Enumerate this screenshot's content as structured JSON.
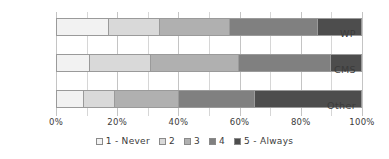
{
  "chart_data": {
    "type": "bar",
    "orientation": "horizontal",
    "stacked": true,
    "normalized": true,
    "title": "",
    "subtitle": "",
    "xlabel": "",
    "ylabel": "",
    "xlim": [
      0,
      100
    ],
    "grid": true,
    "legend_position": "bottom",
    "categories": [
      "WP",
      "CMS",
      "Other"
    ],
    "tick_labels": [
      "0%",
      "20%",
      "40%",
      "60%",
      "80%",
      "100%"
    ],
    "tick_values": [
      0,
      20,
      40,
      60,
      80,
      100
    ],
    "series": [
      {
        "name": "1 - Never",
        "color": "#f2f2f2",
        "values": [
          17,
          11,
          9
        ]
      },
      {
        "name": "2",
        "color": "#d9d9d9",
        "values": [
          17,
          20,
          10
        ]
      },
      {
        "name": "3",
        "color": "#b0b0b0",
        "values": [
          23,
          29,
          21
        ]
      },
      {
        "name": "4",
        "color": "#808080",
        "values": [
          29,
          30,
          25
        ]
      },
      {
        "name": "5 - Always",
        "color": "#4d4d4d",
        "values": [
          14,
          10,
          35
        ]
      }
    ]
  },
  "colors": {
    "background": "#ffffff",
    "text": "#3b3b3b",
    "gridline": "#d6d6d6",
    "bar_outline": "#9a9a9a"
  }
}
